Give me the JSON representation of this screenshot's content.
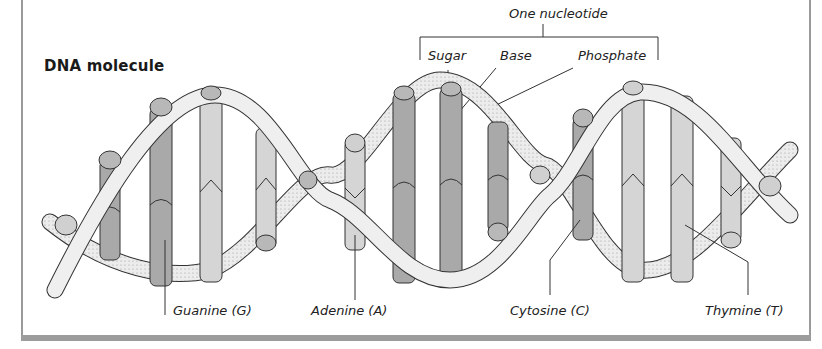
{
  "title": "DNA molecule",
  "nucleotide": {
    "heading": "One nucleotide",
    "parts": [
      "Sugar",
      "Base",
      "Phosphate"
    ]
  },
  "bases": [
    {
      "label": "Guanine (G)"
    },
    {
      "label": "Adenine (A)"
    },
    {
      "label": "Cytosine (C)"
    },
    {
      "label": "Thymine (T)"
    }
  ],
  "colors": {
    "frame": "#9a9a9a",
    "dark_base": "#a9a9a9",
    "light_base": "#d5d5d5",
    "ribbon": "#ececec",
    "outline": "#333333"
  }
}
